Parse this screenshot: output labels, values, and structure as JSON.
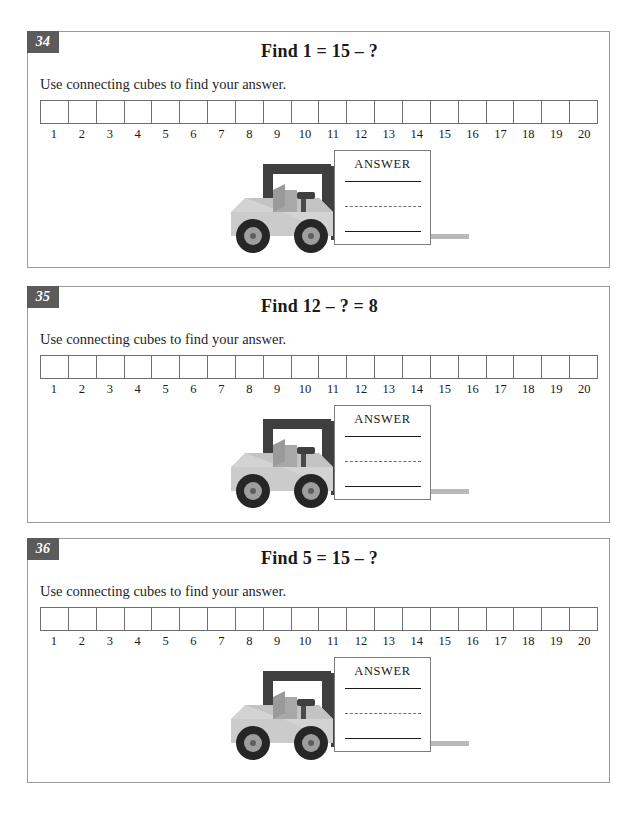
{
  "worksheet": {
    "instruction_text": "Use connecting cubes to find your answer.",
    "answer_label": "ANSWER",
    "strip_labels": [
      "1",
      "2",
      "3",
      "4",
      "5",
      "6",
      "7",
      "8",
      "9",
      "10",
      "11",
      "12",
      "13",
      "14",
      "15",
      "16",
      "17",
      "18",
      "19",
      "20"
    ],
    "colors": {
      "badge_background": "#5b5b5b",
      "badge_text": "#ffffff",
      "panel_border": "#9a9a9a",
      "strip_border": "#6e6e6e",
      "answer_box_border": "#7d7d7d",
      "text": "#1a1a1a",
      "forklift_body": "#d0d0d0",
      "forklift_frame": "#4a4a4a",
      "forklift_tire": "#2b2b2b",
      "forklift_hub": "#9e9e9e"
    },
    "problems": [
      {
        "number": "34",
        "title": "Find 1 = 15 – ?",
        "instruction": "Use connecting cubes to find your answer.",
        "answer_label": "ANSWER"
      },
      {
        "number": "35",
        "title": "Find 12 – ? = 8",
        "instruction": "Use connecting cubes to find your answer.",
        "answer_label": "ANSWER"
      },
      {
        "number": "36",
        "title": "Find 5 = 15 – ?",
        "instruction": "Use connecting cubes to find your answer.",
        "answer_label": "ANSWER"
      }
    ]
  }
}
